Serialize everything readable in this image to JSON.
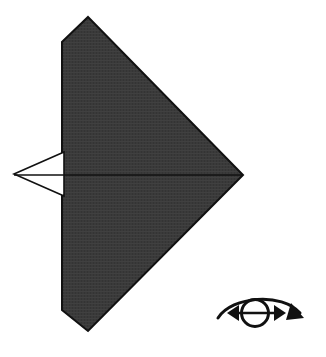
{
  "figure": {
    "kind": "origami-fold-diagram",
    "title": "Origami step diagram",
    "background_color": "#ffffff",
    "canvas": {
      "width": 326,
      "height": 357
    }
  },
  "shapes": {
    "main_model": {
      "name": "folded-paper-body",
      "description": "Large dark kite shape with bevelled top-left and bottom-left corners",
      "fill_color": "#3a3a3a",
      "stroke_color": "#111111",
      "stroke_width": 2,
      "points": "88,17 243,175 88,331 62,310 62,42"
    },
    "flap": {
      "name": "left-point-flap",
      "description": "Thin white triangular flap projecting left from the body",
      "fill_color": "#ffffff",
      "stroke_color": "#111111",
      "stroke_width": 1.6,
      "points": "14,174 64,152 64,196"
    },
    "center_crease": {
      "name": "horizontal-centre-crease",
      "description": "Horizontal fold line running across the model",
      "stroke_color": "#111111",
      "stroke_width": 1.6,
      "x1": 14,
      "y1": 175,
      "x2": 243,
      "y2": 175
    }
  },
  "symbol": {
    "name": "turn-over-symbol",
    "meaning": "turn the model over",
    "stroke_color": "#111111",
    "circle": {
      "cx": 255,
      "cy": 313,
      "r": 13.5,
      "stroke_width": 3
    },
    "axis_line": {
      "x1": 232,
      "y1": 313,
      "x2": 281,
      "y2": 313,
      "stroke_width": 2.6
    },
    "left_arrow_head": "238,305 228,313 238,321",
    "right_arrow_head": "275,305 285,313 275,321",
    "sweep_path": "M 218,318 C 232,296 282,292 300,312",
    "sweep_stroke_width": 3,
    "end_arrow_head": "291,308 302,322 287,322"
  },
  "labels": {
    "figure_caption": "",
    "step_number": ""
  },
  "colors": {
    "paper_dark": "#3a3a3a",
    "paper_light": "#ffffff",
    "ink": "#111111"
  }
}
